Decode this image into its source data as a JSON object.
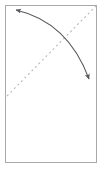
{
  "figure": {
    "title": "Diagonal dashed line with double-headed curved arrow",
    "background_color": "#ffffff",
    "width": 103,
    "height": 171,
    "frame": {
      "name": "panel-border",
      "x": 5,
      "y": 5,
      "width": 92,
      "height": 158,
      "stroke_color": "#a9a9a9",
      "stroke_width": 1,
      "fill": "#ffffff"
    },
    "elements": [
      {
        "id": "dashed-diagonal",
        "kind": "dashed-line",
        "label": "dashed diagonal reference line",
        "from": {
          "x": 7,
          "y": 96
        },
        "to": {
          "x": 96,
          "y": 6
        },
        "stroke_color": "#b8b8b8",
        "stroke_width": 1.1,
        "dash_pattern": "2 3"
      },
      {
        "id": "curved-double-arrow",
        "kind": "curved-arrow",
        "label": "double-headed curved arrow",
        "start": {
          "x": 16,
          "y": 10
        },
        "control": {
          "x": 68,
          "y": 22
        },
        "end": {
          "x": 89,
          "y": 79
        },
        "stroke_color": "#58585c",
        "stroke_width": 1.1,
        "arrowhead_start": true,
        "arrowhead_end": true,
        "arrowhead_color": "#58585c"
      }
    ]
  }
}
